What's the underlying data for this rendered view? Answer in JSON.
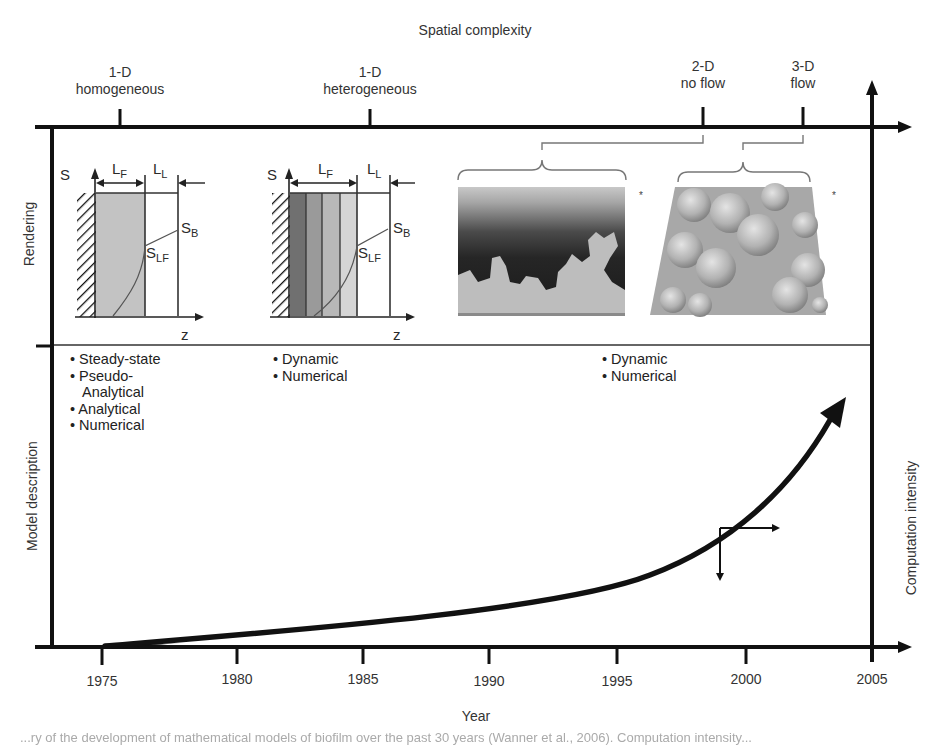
{
  "title": "Spatial complexity",
  "top_axis": {
    "label": "Spatial complexity",
    "categories": [
      {
        "line1": "1-D",
        "line2": "homogeneous"
      },
      {
        "line1": "1-D",
        "line2": "heterogeneous"
      },
      {
        "line1": "2-D",
        "line2": "no flow"
      },
      {
        "line1": "3-D",
        "line2": "flow"
      }
    ]
  },
  "left_axis": {
    "rows": [
      {
        "label": "Rendering"
      },
      {
        "label": "Model description"
      }
    ]
  },
  "right_axis": {
    "label": "Computation intensity"
  },
  "bottom_axis": {
    "label": "Year",
    "ticks": [
      "1975",
      "1980",
      "1985",
      "1990",
      "1995",
      "2000",
      "2005"
    ]
  },
  "renderings": {
    "homogeneous": {
      "s_label": "S",
      "lf_label": "L",
      "lf_sub": "F",
      "ll_label": "L",
      "ll_sub": "L",
      "sb_label": "S",
      "sb_sub": "B",
      "slf_label": "S",
      "slf_sub": "LF",
      "z_label": "z"
    },
    "heterogeneous": {
      "s_label": "S",
      "lf_label": "L",
      "lf_sub": "F",
      "ll_label": "L",
      "ll_sub": "L",
      "sb_label": "S",
      "sb_sub": "B",
      "slf_label": "S",
      "slf_sub": "LF",
      "z_label": "z"
    },
    "asterisk_2d": "*",
    "asterisk_3d": "*"
  },
  "model_descriptions": {
    "homogeneous": [
      "• Steady-state",
      "• Pseudo-",
      "  Analytical",
      "• Analytical",
      "• Numerical"
    ],
    "heterogeneous": [
      "• Dynamic",
      "• Numerical"
    ],
    "multidimensional": [
      "• Dynamic",
      "• Numerical"
    ]
  },
  "caption": "...ry of the development of mathematical models of biofilm over the past 30 years (Wanner et al., 2006). Computation intensity..."
}
